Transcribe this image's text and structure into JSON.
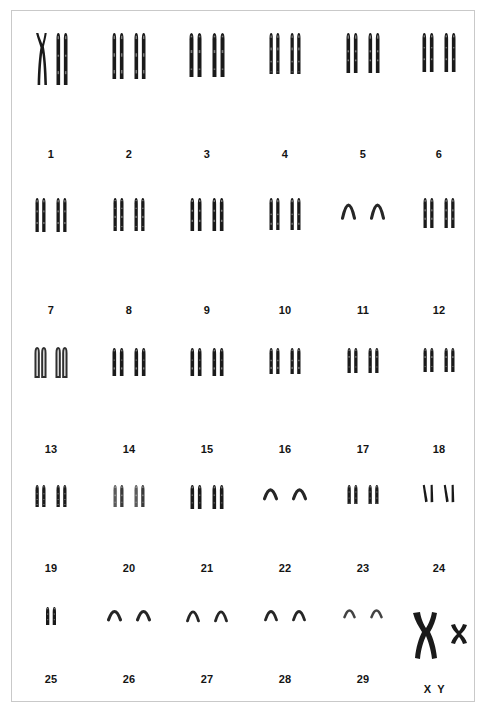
{
  "figure": {
    "species_karyotype": "2n = 60, XY",
    "background_color": "#ffffff",
    "frame_color": "#c9c9c9",
    "stain_color": "#1a1a1a"
  },
  "chart_data": {
    "type": "table",
    "xlabel": "",
    "ylabel": "",
    "categories": [
      "1",
      "2",
      "3",
      "4",
      "5",
      "6",
      "7",
      "8",
      "9",
      "10",
      "11",
      "12",
      "13",
      "14",
      "15",
      "16",
      "17",
      "18",
      "19",
      "20",
      "21",
      "22",
      "23",
      "24",
      "25",
      "26",
      "27",
      "28",
      "29",
      "XY"
    ],
    "values": [
      2,
      2,
      2,
      2,
      2,
      2,
      2,
      2,
      2,
      2,
      2,
      2,
      2,
      2,
      2,
      2,
      2,
      2,
      2,
      2,
      2,
      2,
      2,
      2,
      1,
      2,
      2,
      2,
      2,
      2
    ],
    "series": [
      {
        "name": "chromosome count per labelled group",
        "values": [
          2,
          2,
          2,
          2,
          2,
          2,
          2,
          2,
          2,
          2,
          2,
          2,
          2,
          2,
          2,
          2,
          2,
          2,
          2,
          2,
          2,
          2,
          2,
          2,
          1,
          2,
          2,
          2,
          2,
          2
        ]
      }
    ],
    "legend_position": "none",
    "grid": false
  },
  "rows": [
    {
      "row_index": 0,
      "row_top": 18,
      "label_top": 137,
      "cells": [
        {
          "label": "1",
          "left": 0,
          "width": 78,
          "count": 2,
          "height": 52,
          "width_px": 11,
          "shape": "crossed-metacentric-pair",
          "note": "left chromatid pair crossed X-shape"
        },
        {
          "label": "2",
          "left": 78,
          "width": 78,
          "count": 2,
          "height": 46,
          "width_px": 11,
          "shape": "acrocentric"
        },
        {
          "label": "3",
          "left": 156,
          "width": 78,
          "count": 2,
          "height": 44,
          "width_px": 12,
          "shape": "acrocentric"
        },
        {
          "label": "4",
          "left": 234,
          "width": 78,
          "count": 2,
          "height": 41,
          "width_px": 10,
          "shape": "acrocentric"
        },
        {
          "label": "5",
          "left": 312,
          "width": 78,
          "count": 2,
          "height": 40,
          "width_px": 11,
          "shape": "acrocentric"
        },
        {
          "label": "6",
          "left": 390,
          "width": 74,
          "count": 2,
          "height": 39,
          "width_px": 11,
          "shape": "acrocentric"
        }
      ]
    },
    {
      "row_index": 1,
      "row_top": 183,
      "label_top": 293,
      "cells": [
        {
          "label": "7",
          "left": 0,
          "width": 78,
          "count": 2,
          "height": 34,
          "width_px": 10,
          "shape": "acrocentric"
        },
        {
          "label": "8",
          "left": 78,
          "width": 78,
          "count": 2,
          "height": 33,
          "width_px": 10,
          "shape": "acrocentric"
        },
        {
          "label": "9",
          "left": 156,
          "width": 78,
          "count": 2,
          "height": 33,
          "width_px": 11,
          "shape": "acrocentric"
        },
        {
          "label": "10",
          "left": 234,
          "width": 78,
          "count": 2,
          "height": 32,
          "width_px": 10,
          "shape": "acrocentric"
        },
        {
          "label": "11",
          "left": 312,
          "width": 78,
          "count": 2,
          "height": 22,
          "width_px": 12,
          "shape": "thin-arc"
        },
        {
          "label": "12",
          "left": 390,
          "width": 74,
          "count": 2,
          "height": 30,
          "width_px": 10,
          "shape": "acrocentric"
        }
      ]
    },
    {
      "row_index": 2,
      "row_top": 333,
      "label_top": 432,
      "cells": [
        {
          "label": "13",
          "left": 0,
          "width": 78,
          "count": 2,
          "height": 29,
          "width_px": 10,
          "shape": "open-acrocentric"
        },
        {
          "label": "14",
          "left": 78,
          "width": 78,
          "count": 2,
          "height": 28,
          "width_px": 11,
          "shape": "acrocentric"
        },
        {
          "label": "15",
          "left": 156,
          "width": 78,
          "count": 2,
          "height": 28,
          "width_px": 11,
          "shape": "acrocentric"
        },
        {
          "label": "16",
          "left": 234,
          "width": 78,
          "count": 2,
          "height": 26,
          "width_px": 10,
          "shape": "acrocentric"
        },
        {
          "label": "17",
          "left": 312,
          "width": 78,
          "count": 2,
          "height": 25,
          "width_px": 10,
          "shape": "acrocentric"
        },
        {
          "label": "18",
          "left": 390,
          "width": 74,
          "count": 2,
          "height": 24,
          "width_px": 10,
          "shape": "acrocentric"
        }
      ]
    },
    {
      "row_index": 3,
      "row_top": 470,
      "label_top": 551,
      "cells": [
        {
          "label": "19",
          "left": 0,
          "width": 78,
          "count": 2,
          "height": 22,
          "width_px": 10,
          "shape": "acrocentric"
        },
        {
          "label": "20",
          "left": 78,
          "width": 78,
          "count": 2,
          "height": 22,
          "width_px": 10,
          "shape": "faint-acrocentric"
        },
        {
          "label": "21",
          "left": 156,
          "width": 78,
          "count": 2,
          "height": 24,
          "width_px": 11,
          "shape": "acrocentric"
        },
        {
          "label": "22",
          "left": 234,
          "width": 78,
          "count": 2,
          "height": 15,
          "width_px": 12,
          "shape": "thin-arc"
        },
        {
          "label": "23",
          "left": 312,
          "width": 78,
          "count": 2,
          "height": 19,
          "width_px": 10,
          "shape": "acrocentric"
        },
        {
          "label": "24",
          "left": 390,
          "width": 74,
          "count": 2,
          "height": 17,
          "width_px": 10,
          "shape": "slanted-chromatids"
        }
      ]
    },
    {
      "row_index": 4,
      "row_top": 592,
      "label_top": 662,
      "cells": [
        {
          "label": "25",
          "left": 0,
          "width": 78,
          "count": 1,
          "height": 18,
          "width_px": 10,
          "shape": "acrocentric"
        },
        {
          "label": "26",
          "left": 78,
          "width": 78,
          "count": 2,
          "height": 14,
          "width_px": 12,
          "shape": "thin-arc"
        },
        {
          "label": "27",
          "left": 156,
          "width": 78,
          "count": 2,
          "height": 15,
          "width_px": 11,
          "shape": "thin-arc"
        },
        {
          "label": "28",
          "left": 234,
          "width": 78,
          "count": 2,
          "height": 14,
          "width_px": 11,
          "shape": "thin-arc"
        },
        {
          "label": "29",
          "left": 312,
          "width": 78,
          "count": 2,
          "height": 11,
          "width_px": 10,
          "shape": "tiny-arc"
        }
      ]
    }
  ],
  "sex_chromosomes": {
    "label": "X Y",
    "x_name": "X",
    "y_name": "Y",
    "x_shape": "large-metacentric",
    "y_shape": "small-metacentric"
  }
}
